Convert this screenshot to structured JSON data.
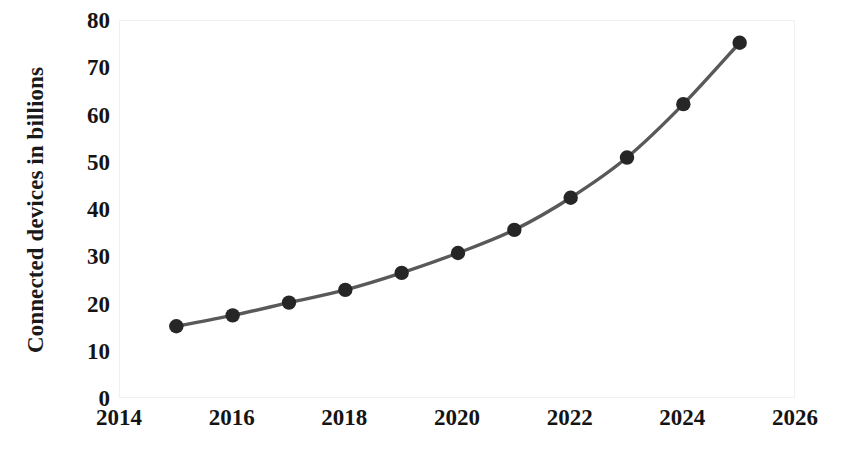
{
  "chart_data": {
    "type": "line",
    "title": "",
    "subtitle": "",
    "xlabel": "",
    "ylabel": "Connected devices in billions",
    "x": [
      2015,
      2016,
      2017,
      2018,
      2019,
      2020,
      2021,
      2022,
      2023,
      2024,
      2025
    ],
    "values": [
      15.4,
      17.7,
      20.4,
      23.1,
      26.7,
      30.9,
      35.8,
      42.6,
      51.1,
      62.4,
      75.4
    ],
    "series": [
      {
        "name": "Connected devices",
        "values": [
          15.4,
          17.7,
          20.4,
          23.1,
          26.7,
          30.9,
          35.8,
          42.6,
          51.1,
          62.4,
          75.4
        ]
      }
    ],
    "xlim": [
      2014,
      2026
    ],
    "ylim": [
      0,
      80
    ],
    "xticks": [
      2014,
      2016,
      2018,
      2020,
      2022,
      2024,
      2026
    ],
    "yticks": [
      0,
      10,
      20,
      30,
      40,
      50,
      60,
      70,
      80
    ],
    "xtick_labels": [
      "2014",
      "2016",
      "2018",
      "2020",
      "2022",
      "2024",
      "2026"
    ],
    "ytick_labels": [
      "0",
      "10",
      "20",
      "30",
      "40",
      "50",
      "60",
      "70",
      "80"
    ],
    "grid": false,
    "legend": false,
    "legend_position": "none",
    "annotations": [],
    "line_color": "#595959",
    "marker_color": "#262626",
    "marker_shape": "circle",
    "plot_background": "#ffffff",
    "border_color": "#f0f0f0"
  }
}
